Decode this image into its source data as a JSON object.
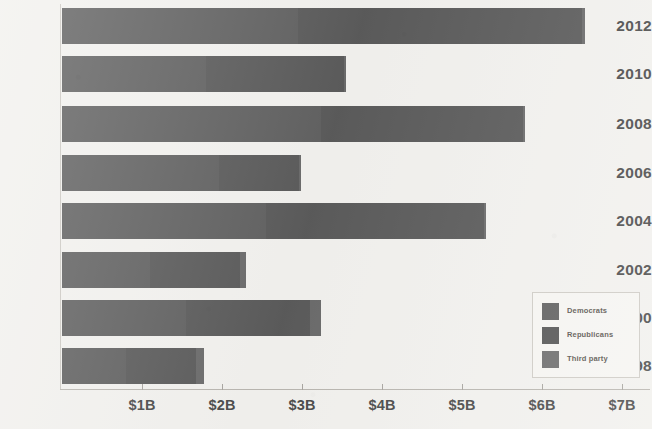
{
  "chart_data": {
    "type": "bar",
    "orientation": "horizontal",
    "stacked": true,
    "title": "",
    "subtitle": "",
    "xlabel": "",
    "ylabel": "",
    "categories": [
      "2012",
      "2010",
      "2008",
      "2006",
      "2004",
      "2002",
      "2000",
      "1998"
    ],
    "series": [
      {
        "name": "Democrats",
        "color": "#616161",
        "values": [
          2.95,
          1.8,
          3.24,
          1.96,
          2.55,
          1.1,
          1.55,
          0.8
        ]
      },
      {
        "name": "Republicans",
        "color": "#5b5b5b",
        "values": [
          3.55,
          1.72,
          2.52,
          1.0,
          2.72,
          1.12,
          1.55,
          0.88
        ]
      },
      {
        "name": "Third party",
        "color": "#6b6b6b",
        "values": [
          0.04,
          0.03,
          0.03,
          0.03,
          0.03,
          0.08,
          0.14,
          0.1
        ]
      }
    ],
    "totals": [
      6.54,
      3.55,
      5.79,
      2.99,
      5.3,
      2.3,
      3.24,
      1.78
    ],
    "xlim": [
      0,
      7
    ],
    "xticks": [
      1,
      2,
      3,
      4,
      5,
      6,
      7
    ],
    "xtick_labels": [
      "$1B",
      "$2B",
      "$3B",
      "$4B",
      "$5B",
      "$6B",
      "$7B"
    ],
    "grid": false,
    "legend_position": "bottom-right",
    "units": "billions of US dollars",
    "background_color": "#f2f1ee",
    "axis_color": "#b9b6b0",
    "text_color": "#4b4b4b"
  },
  "legend": {
    "items": [
      {
        "label": "Democrats",
        "color": "#616161"
      },
      {
        "label": "Republicans",
        "color": "#565656"
      },
      {
        "label": "Third party",
        "color": "#6e6e6e"
      }
    ]
  }
}
